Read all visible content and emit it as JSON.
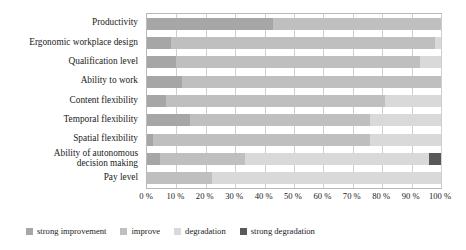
{
  "chart_data": {
    "type": "bar",
    "orientation": "horizontal",
    "stacked": true,
    "normalized": true,
    "title": "",
    "subtitle": "",
    "xlabel": "",
    "ylabel": "",
    "xlim": [
      0,
      100
    ],
    "grid": true,
    "legend_position": "bottom",
    "x_ticks": [
      0,
      10,
      20,
      30,
      40,
      50,
      60,
      70,
      80,
      90,
      100
    ],
    "x_tick_labels": [
      "0 %",
      "10 %",
      "20 %",
      "30 %",
      "40 %",
      "50 %",
      "60 %",
      "70 %",
      "80 %",
      "90 %",
      "100 %"
    ],
    "categories": [
      "Productivity",
      "Ergonomic workplace design",
      "Qualification level",
      "Ability to work",
      "Content flexibility",
      "Temporal flexibility",
      "Spatial flexibility",
      "Ability of autonomous decision making",
      "Pay level"
    ],
    "series": [
      {
        "name": "strong improvement",
        "color": "#a6a6a6",
        "values": [
          43.0,
          8.0,
          10.0,
          12.0,
          6.5,
          14.5,
          2.0,
          4.5,
          0.0
        ]
      },
      {
        "name": "improve",
        "color": "#bfbfbf",
        "values": [
          57.0,
          90.0,
          83.0,
          88.0,
          74.5,
          61.5,
          74.0,
          29.0,
          22.0
        ]
      },
      {
        "name": "degradation",
        "color": "#d9d9d9",
        "values": [
          0.0,
          2.0,
          7.0,
          0.0,
          19.0,
          24.0,
          24.0,
          62.5,
          78.0
        ]
      },
      {
        "name": "strong degradation",
        "color": "#595959",
        "values": [
          0.0,
          0.0,
          0.0,
          0.0,
          0.0,
          0.0,
          0.0,
          4.0,
          0.0
        ]
      }
    ]
  },
  "legend": {
    "items": [
      {
        "label": "strong improvement",
        "color": "#a6a6a6"
      },
      {
        "label": "improve",
        "color": "#bfbfbf"
      },
      {
        "label": "degradation",
        "color": "#d9d9d9"
      },
      {
        "label": "strong degradation",
        "color": "#595959"
      }
    ]
  }
}
